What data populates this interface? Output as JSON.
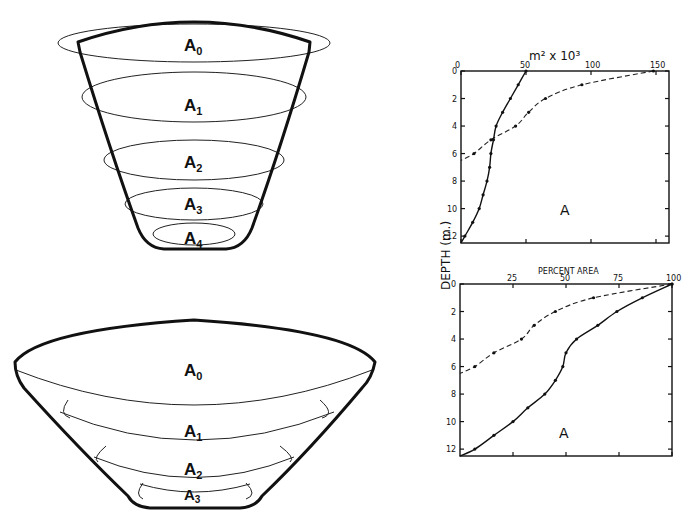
{
  "figure": {
    "cone_top": {
      "labels": [
        {
          "base": "A",
          "sub": "0"
        },
        {
          "base": "A",
          "sub": "1"
        },
        {
          "base": "A",
          "sub": "2"
        },
        {
          "base": "A",
          "sub": "3"
        },
        {
          "base": "A",
          "sub": "4"
        }
      ]
    },
    "bowl_bottom": {
      "labels": [
        {
          "base": "A",
          "sub": "0"
        },
        {
          "base": "A",
          "sub": "1"
        },
        {
          "base": "A",
          "sub": "2"
        },
        {
          "base": "A",
          "sub": "3"
        }
      ]
    },
    "shared_y_label": "DEPTH  (m.)"
  },
  "chart_data": [
    {
      "type": "line",
      "title": "m² x 10³",
      "xlabel": "m² x 10³",
      "ylabel": "DEPTH (m.)",
      "x_ticks": [
        "0",
        "50",
        "100",
        "150"
      ],
      "y_ticks": [
        "0",
        "2",
        "4",
        "6",
        "8",
        "10",
        "12"
      ],
      "xlim": [
        0,
        160
      ],
      "ylim": [
        12.5,
        0
      ],
      "x_axis_position": "top",
      "grid": false,
      "annotation": "A",
      "series": [
        {
          "name": "solid",
          "style": "solid",
          "depth": [
            0,
            1,
            2,
            3,
            4,
            5,
            6,
            7,
            8,
            9,
            10,
            11,
            12,
            12.5
          ],
          "values": [
            50,
            44,
            38,
            32,
            27,
            25,
            23,
            22,
            20,
            17,
            14,
            9,
            3,
            0
          ]
        },
        {
          "name": "dashed",
          "style": "dashed",
          "depth": [
            0,
            1,
            2,
            3,
            4,
            5,
            6,
            6.5
          ],
          "values": [
            148,
            93,
            65,
            52,
            42,
            23,
            10,
            0
          ]
        }
      ]
    },
    {
      "type": "line",
      "title": "PERCENT AREA",
      "xlabel": "PERCENT AREA",
      "ylabel": "DEPTH (m.)",
      "x_ticks": [
        "25",
        "50",
        "75",
        "100"
      ],
      "y_ticks": [
        "0",
        "2",
        "4",
        "6",
        "8",
        "10",
        "12"
      ],
      "xlim": [
        0,
        100
      ],
      "ylim": [
        12.5,
        0
      ],
      "x_axis_position": "top",
      "grid": false,
      "annotation": "A",
      "series": [
        {
          "name": "solid",
          "style": "solid",
          "depth": [
            0,
            1,
            2,
            3,
            4,
            5,
            6,
            7,
            8,
            9,
            10,
            11,
            12,
            12.5
          ],
          "values": [
            100,
            86,
            74,
            65,
            55,
            50,
            48.5,
            45,
            40,
            32,
            25,
            16,
            7,
            0
          ]
        },
        {
          "name": "dashed",
          "style": "dashed",
          "depth": [
            0,
            1,
            2,
            3,
            4,
            5,
            6,
            6.5
          ],
          "values": [
            100,
            63,
            45,
            35,
            29,
            16,
            7,
            0
          ]
        }
      ]
    }
  ]
}
